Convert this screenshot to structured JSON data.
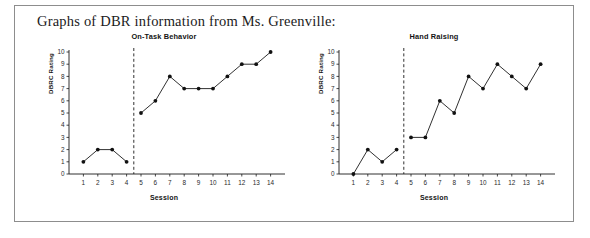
{
  "document": {
    "heading": "Graphs of DBR information from Ms. Greenville:"
  },
  "charts": [
    {
      "title": "On-Task Behavior",
      "xlabel": "Session",
      "ylabel": "DBRC Rating"
    },
    {
      "title": "Hand Raising",
      "xlabel": "Session",
      "ylabel": "DBRC Rating"
    }
  ],
  "chart_data": [
    {
      "type": "line",
      "title": "On-Task Behavior",
      "xlabel": "Session",
      "ylabel": "DBRC Rating",
      "xlim": [
        0,
        15
      ],
      "ylim": [
        0,
        10
      ],
      "xticks": [
        1,
        2,
        3,
        4,
        5,
        6,
        7,
        8,
        9,
        10,
        11,
        12,
        13,
        14
      ],
      "yticks": [
        0,
        1,
        2,
        3,
        4,
        5,
        6,
        7,
        8,
        9,
        10
      ],
      "grid": false,
      "legend": "none",
      "phase_line_x": 4.5,
      "phase_line_style": "dashed",
      "series": [
        {
          "name": "Baseline",
          "x": [
            1,
            2,
            3,
            4
          ],
          "values": [
            1,
            2,
            2,
            1
          ]
        },
        {
          "name": "Intervention",
          "x": [
            5,
            6,
            7,
            8,
            9,
            10,
            11,
            12,
            13,
            14
          ],
          "values": [
            5,
            6,
            8,
            7,
            7,
            7,
            8,
            9,
            9,
            10
          ]
        }
      ]
    },
    {
      "type": "line",
      "title": "Hand Raising",
      "xlabel": "Session",
      "ylabel": "DBRC Rating",
      "xlim": [
        0,
        15
      ],
      "ylim": [
        0,
        10
      ],
      "xticks": [
        1,
        2,
        3,
        4,
        5,
        6,
        7,
        8,
        9,
        10,
        11,
        12,
        13,
        14
      ],
      "yticks": [
        0,
        1,
        2,
        3,
        4,
        5,
        6,
        7,
        8,
        9,
        10
      ],
      "grid": false,
      "legend": "none",
      "phase_line_x": 4.5,
      "phase_line_style": "dashed",
      "series": [
        {
          "name": "Baseline",
          "x": [
            1,
            2,
            3,
            4
          ],
          "values": [
            0,
            2,
            1,
            2
          ]
        },
        {
          "name": "Intervention",
          "x": [
            5,
            6,
            7,
            8,
            9,
            10,
            11,
            12,
            13,
            14
          ],
          "values": [
            3,
            3,
            6,
            5,
            8,
            7,
            9,
            8,
            7,
            9
          ]
        }
      ]
    }
  ],
  "colors": {
    "line": "#1a1a1a",
    "marker": "#111111",
    "axis": "#1a1a1a",
    "frame_border": "#8d8d8d"
  }
}
